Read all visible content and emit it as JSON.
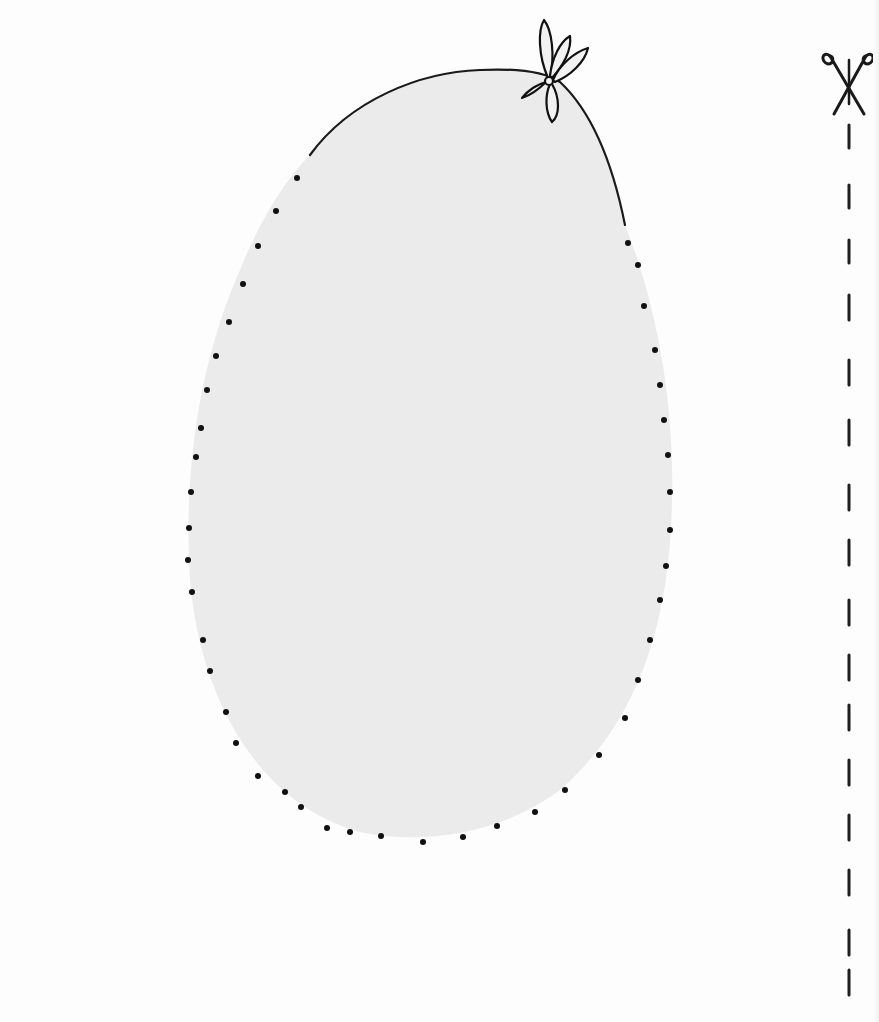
{
  "page": {
    "background": "#fdfdfd"
  },
  "balloon": {
    "fill": "#ebebeb",
    "outline_color": "#1a1a1a",
    "dot_color": "#111111",
    "icon": "balloon-shape"
  },
  "knot": {
    "icon": "balloon-knot-bow-icon"
  },
  "cut_line": {
    "icon": "scissors-icon",
    "dash_color": "#1f1f1f",
    "x": 849,
    "dashes": [
      [
        125,
        148
      ],
      [
        185,
        208
      ],
      [
        240,
        263
      ],
      [
        295,
        320
      ],
      [
        360,
        385
      ],
      [
        420,
        445
      ],
      [
        485,
        510
      ],
      [
        540,
        565
      ],
      [
        600,
        625
      ],
      [
        655,
        680
      ],
      [
        705,
        730
      ],
      [
        760,
        785
      ],
      [
        815,
        840
      ],
      [
        870,
        895
      ],
      [
        930,
        955
      ],
      [
        970,
        995
      ]
    ]
  },
  "dots": [
    [
      297,
      178
    ],
    [
      276,
      211
    ],
    [
      258,
      246
    ],
    [
      243,
      284
    ],
    [
      229,
      322
    ],
    [
      216,
      356
    ],
    [
      207,
      390
    ],
    [
      201,
      428
    ],
    [
      196,
      457
    ],
    [
      191,
      492
    ],
    [
      189,
      528
    ],
    [
      188,
      560
    ],
    [
      192,
      592
    ],
    [
      203,
      640
    ],
    [
      210,
      671
    ],
    [
      226,
      712
    ],
    [
      236,
      743
    ],
    [
      258,
      776
    ],
    [
      285,
      792
    ],
    [
      301,
      807
    ],
    [
      327,
      828
    ],
    [
      350,
      832
    ],
    [
      381,
      836
    ],
    [
      423,
      842
    ],
    [
      463,
      837
    ],
    [
      497,
      826
    ],
    [
      535,
      812
    ],
    [
      565,
      790
    ],
    [
      599,
      755
    ],
    [
      625,
      718
    ],
    [
      638,
      680
    ],
    [
      650,
      640
    ],
    [
      660,
      600
    ],
    [
      666,
      566
    ],
    [
      670,
      530
    ],
    [
      670,
      492
    ],
    [
      668,
      455
    ],
    [
      664,
      420
    ],
    [
      660,
      385
    ],
    [
      655,
      350
    ],
    [
      644,
      306
    ],
    [
      638,
      265
    ],
    [
      628,
      243
    ]
  ]
}
